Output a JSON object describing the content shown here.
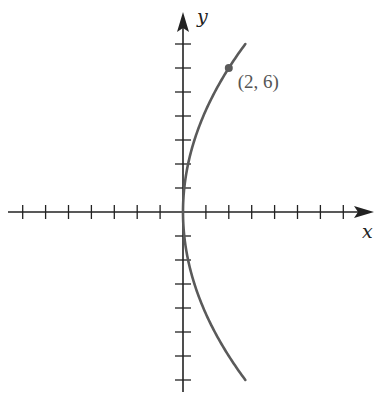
{
  "chart_data": {
    "type": "line",
    "title": "",
    "equation_hint": "y^2 = 18x",
    "xlabel": "x",
    "ylabel": "y",
    "xlim": [
      -7.5,
      8.5
    ],
    "ylim": [
      -7.5,
      8.3
    ],
    "grid": false,
    "tick_step": 1,
    "series": [
      {
        "name": "curve",
        "color": "#555555",
        "points": [
          {
            "x": 2.72,
            "y": -7
          },
          {
            "x": 2.0,
            "y": -6
          },
          {
            "x": 1.39,
            "y": -5
          },
          {
            "x": 0.89,
            "y": -4
          },
          {
            "x": 0.5,
            "y": -3
          },
          {
            "x": 0.22,
            "y": -2
          },
          {
            "x": 0.06,
            "y": -1
          },
          {
            "x": 0,
            "y": 0
          },
          {
            "x": 0.06,
            "y": 1
          },
          {
            "x": 0.22,
            "y": 2
          },
          {
            "x": 0.5,
            "y": 3
          },
          {
            "x": 0.89,
            "y": 4
          },
          {
            "x": 1.39,
            "y": 5
          },
          {
            "x": 2.0,
            "y": 6
          },
          {
            "x": 2.72,
            "y": 7
          }
        ]
      }
    ],
    "annotations": [
      {
        "type": "point",
        "x": 2,
        "y": 6,
        "label": "(2, 6)"
      }
    ]
  },
  "labels": {
    "x_axis": "x",
    "y_axis": "y",
    "point": "(2, 6)"
  },
  "colors": {
    "axis": "#222222",
    "curve": "#5a5a5a",
    "point": "#5a5a5a"
  }
}
